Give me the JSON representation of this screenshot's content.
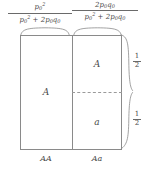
{
  "figure": {
    "colors": {
      "line": "#8a8a8a",
      "dashed": "#9a9a9a",
      "text": "#4a4a4a",
      "background": "#ffffff"
    }
  },
  "top_labels": {
    "left": {
      "numerator_base": "p",
      "numerator_sub": "0",
      "numerator_exp": "2",
      "denominator_term1_base": "p",
      "denominator_term1_sub": "0",
      "denominator_term1_exp": "2",
      "denominator_plus": "+",
      "denominator_term2_coef": "2",
      "denominator_term2_p": "p",
      "denominator_term2_p_sub": "0",
      "denominator_term2_q": "q",
      "denominator_term2_q_sub": "0",
      "plain": "p0^2 / (p0^2 + 2p0q0)"
    },
    "right": {
      "numerator_coef": "2",
      "numerator_p": "p",
      "numerator_p_sub": "0",
      "numerator_q": "q",
      "numerator_q_sub": "0",
      "denominator_term1_base": "p",
      "denominator_term1_sub": "0",
      "denominator_term1_exp": "2",
      "denominator_plus": "+",
      "denominator_term2_coef": "2",
      "denominator_term2_p": "p",
      "denominator_term2_p_sub": "0",
      "denominator_term2_q": "q",
      "denominator_term2_q_sub": "0",
      "plain": "2p0q0 / (p0^2 + 2p0q0)"
    }
  },
  "cells": {
    "left_column_letter": "A",
    "right_column_upper_letter": "A",
    "right_column_lower_letter": "a"
  },
  "bottom_labels": {
    "left": "AA",
    "right": "Aa"
  },
  "side_labels": {
    "upper": {
      "numerator": "1",
      "denominator": "2",
      "plain": "1/2"
    },
    "lower": {
      "numerator": "1",
      "denominator": "2",
      "plain": "1/2"
    }
  }
}
